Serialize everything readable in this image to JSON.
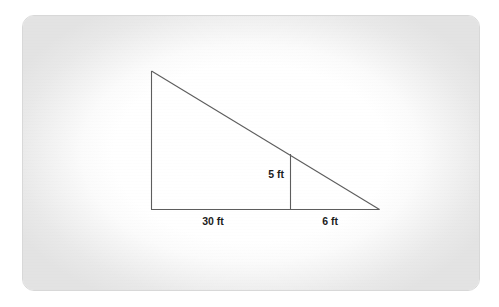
{
  "document": {
    "kind": "geometry-diagram",
    "background_color": "#ffffff",
    "card_background_color": "#ffffff",
    "card_edge_color": "#e3e3e3",
    "card_border_color": "#d8d8d8",
    "line_color": "#5d5d5d",
    "label_color": "#1c1c1c"
  },
  "figure": {
    "name": "right-triangle-with-interior-vertical-segment",
    "shape": "right triangle",
    "labels": {
      "base_left": "30 ft",
      "base_right": "6 ft",
      "interior_vertical": "5 ft"
    },
    "geometry": {
      "apex": {
        "x": 128,
        "y": 55
      },
      "bottom_left": {
        "x": 128,
        "y": 193
      },
      "bottom_right": {
        "x": 356,
        "y": 193
      },
      "interior_foot": {
        "x": 267,
        "y": 193
      },
      "interior_top": {
        "x": 267,
        "y": 138
      }
    },
    "label_positions": {
      "base_left": {
        "x": 190,
        "y": 207
      },
      "base_right": {
        "x": 305,
        "y": 207
      },
      "interior_vertical": {
        "x": 253,
        "y": 162
      }
    }
  },
  "measurements": {
    "units": "ft",
    "base_left_segment": 30,
    "base_right_segment": 6,
    "interior_height": 5,
    "total_base": 36
  }
}
